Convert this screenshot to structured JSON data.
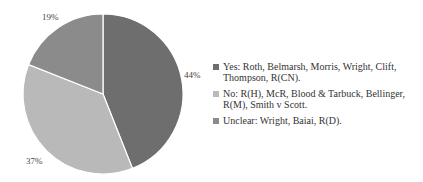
{
  "chart_data": {
    "type": "pie",
    "title": "",
    "start_angle_deg": 0,
    "direction": "clockwise",
    "categories": [
      "Yes",
      "No",
      "Unclear"
    ],
    "values": [
      44,
      37,
      19
    ],
    "labels": [
      "44%",
      "37%",
      "19%"
    ],
    "colors": [
      "#6e6e6e",
      "#b9b9b9",
      "#8b8b8b"
    ],
    "legend_position": "right",
    "legend": [
      {
        "label": "Yes: Roth, Belmarsh, Morris, Wright, Clift, Thompson, R(CN).",
        "color": "#6e6e6e"
      },
      {
        "label": "No: R(H), McR, Blood & Tarbuck, Bellinger, R(M), Smith v Scott.",
        "color": "#b9b9b9"
      },
      {
        "label": "Unclear: Wright, Baiai, R(D).",
        "color": "#8b8b8b"
      }
    ]
  }
}
